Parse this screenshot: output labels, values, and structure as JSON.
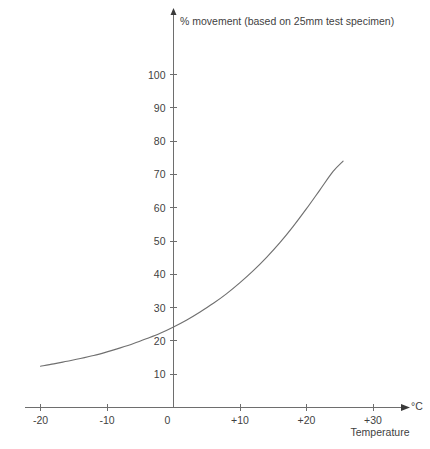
{
  "chart_data": {
    "type": "line",
    "title": "",
    "ylabel": "% movement (based on 25mm test specimen)",
    "xlabel": "Temperature",
    "x_unit": "°C",
    "xlim": [
      -22,
      35
    ],
    "ylim": [
      0,
      108
    ],
    "grid": false,
    "legend": null,
    "x_ticks": [
      {
        "value": -20,
        "label": "-20"
      },
      {
        "value": -10,
        "label": "-10"
      },
      {
        "value": 0,
        "label": "0"
      },
      {
        "value": 10,
        "label": "+10"
      },
      {
        "value": 20,
        "label": "+20"
      },
      {
        "value": 30,
        "label": "+30"
      }
    ],
    "y_ticks": [
      {
        "value": 10,
        "label": "10"
      },
      {
        "value": 20,
        "label": "20"
      },
      {
        "value": 30,
        "label": "30"
      },
      {
        "value": 40,
        "label": "40"
      },
      {
        "value": 50,
        "label": "50"
      },
      {
        "value": 60,
        "label": "60"
      },
      {
        "value": 70,
        "label": "70"
      },
      {
        "value": 80,
        "label": "80"
      },
      {
        "value": 90,
        "label": "90"
      },
      {
        "value": 100,
        "label": "100"
      }
    ],
    "series": [
      {
        "name": "movement",
        "x": [
          -20,
          -18,
          -16,
          -14,
          -12,
          -10,
          -8,
          -6,
          -4,
          -2,
          0,
          2,
          4,
          6,
          8,
          10,
          12,
          14,
          16,
          18,
          20,
          22,
          24,
          25.5
        ],
        "values": [
          12.4,
          13.1,
          13.9,
          14.7,
          15.6,
          16.7,
          17.9,
          19.2,
          20.7,
          22.3,
          24.2,
          26.3,
          28.7,
          31.3,
          34.2,
          37.5,
          41.1,
          45.1,
          49.5,
          54.4,
          59.7,
          65.3,
          70.9,
          74.0
        ]
      }
    ]
  },
  "axes": {
    "y_axis_title": "% movement (based on 25mm test specimen)",
    "x_axis_title": "Temperature",
    "x_axis_unit": "°C"
  },
  "colors": {
    "background": "#ffffff",
    "axis": "#6e6e6e",
    "curve": "#707070",
    "text": "#3f3f3f"
  }
}
